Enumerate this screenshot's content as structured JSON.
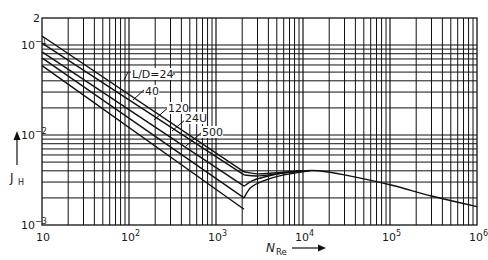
{
  "chart_data": {
    "type": "line",
    "title": "",
    "xlabel": "N_Re",
    "xlabel_main": "N",
    "xlabel_sub": "Re",
    "ylabel": "J_H",
    "ylabel_main": "J",
    "ylabel_sub": "H",
    "xscale": "log",
    "yscale": "log",
    "xlim": [
      10,
      1000000
    ],
    "ylim": [
      0.001,
      0.2
    ],
    "grid": true,
    "x_ticks": [
      {
        "value": 10,
        "base": "10",
        "exp": ""
      },
      {
        "value": 100,
        "base": "10",
        "exp": "2"
      },
      {
        "value": 1000,
        "base": "10",
        "exp": "3"
      },
      {
        "value": 10000,
        "base": "10",
        "exp": "4"
      },
      {
        "value": 100000,
        "base": "10",
        "exp": "5"
      },
      {
        "value": 1000000,
        "base": "10",
        "exp": "6"
      }
    ],
    "y_ticks": [
      {
        "value": 0.2,
        "base": "2",
        "exp": ""
      },
      {
        "value": 0.1,
        "base": "10",
        "exp": "−1"
      },
      {
        "value": 0.01,
        "base": "10",
        "exp": "−2"
      },
      {
        "value": 0.001,
        "base": "10",
        "exp": "−3"
      }
    ],
    "series": [
      {
        "name": "L/D=24",
        "points": [
          [
            10,
            0.126
          ],
          [
            2100,
            0.0039
          ]
        ]
      },
      {
        "name": "40",
        "points": [
          [
            10,
            0.105
          ],
          [
            2100,
            0.0036
          ]
        ]
      },
      {
        "name": "120",
        "points": [
          [
            10,
            0.084
          ],
          [
            2100,
            0.0027
          ]
        ]
      },
      {
        "name": "240",
        "points": [
          [
            10,
            0.072
          ],
          [
            2100,
            0.002
          ]
        ]
      },
      {
        "name": "500",
        "points": [
          [
            10,
            0.059
          ],
          [
            2100,
            0.0015
          ]
        ]
      },
      {
        "name": "transition-24",
        "points": [
          [
            2100,
            0.0039
          ],
          [
            3000,
            0.0037
          ],
          [
            5000,
            0.0038
          ],
          [
            10000,
            0.004
          ]
        ]
      },
      {
        "name": "transition-40",
        "points": [
          [
            2100,
            0.0036
          ],
          [
            3000,
            0.0035
          ],
          [
            5000,
            0.0037
          ],
          [
            10000,
            0.004
          ]
        ]
      },
      {
        "name": "transition-120",
        "points": [
          [
            2100,
            0.0027
          ],
          [
            2600,
            0.0031
          ],
          [
            3500,
            0.0034
          ],
          [
            6000,
            0.0038
          ],
          [
            10000,
            0.004
          ]
        ]
      },
      {
        "name": "transition-240",
        "points": [
          [
            2100,
            0.002
          ],
          [
            2500,
            0.0026
          ],
          [
            3500,
            0.0031
          ],
          [
            6000,
            0.0036
          ],
          [
            12000,
            0.004
          ]
        ]
      },
      {
        "name": "turbulent",
        "points": [
          [
            10000,
            0.004
          ],
          [
            15000,
            0.004
          ],
          [
            30000,
            0.0036
          ],
          [
            100000,
            0.0028
          ],
          [
            300000,
            0.0021
          ],
          [
            1000000,
            0.0016
          ]
        ]
      }
    ],
    "annotations": [
      {
        "text": "L/D=24",
        "x_px": 132,
        "y_px": 78,
        "leader": [
          [
            128,
            72
          ],
          [
            124,
            80
          ]
        ],
        "leader2": [
          [
            163,
            74
          ],
          [
            175,
            74
          ]
        ]
      },
      {
        "text": "40",
        "x_px": 145,
        "y_px": 95,
        "leader": [
          [
            147,
            87
          ],
          [
            133,
            100
          ]
        ]
      },
      {
        "text": "120",
        "x_px": 168,
        "y_px": 112,
        "leader": [
          [
            170,
            106
          ],
          [
            154,
            120
          ]
        ]
      },
      {
        "text": "24U",
        "x_px": 185,
        "y_px": 122,
        "leader": [
          [
            186,
            119
          ],
          [
            172,
            131
          ]
        ]
      },
      {
        "text": "500",
        "x_px": 202,
        "y_px": 136,
        "leader": [
          [
            202,
            132
          ],
          [
            186,
            146
          ]
        ]
      }
    ]
  }
}
